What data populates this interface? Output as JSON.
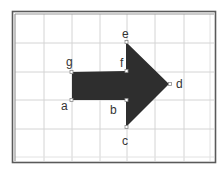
{
  "diagram": {
    "type": "arrow-on-grid",
    "colors": {
      "background": "#ffffff",
      "frame": "#5a5a5a",
      "frame_inner": "#9a9a9a",
      "grid": "#d4d4d4",
      "arrow_fill": "#2e2e2e",
      "point": "#8a8a8a",
      "label": "#333333"
    },
    "points": [
      {
        "name": "a",
        "label": "a"
      },
      {
        "name": "b",
        "label": "b"
      },
      {
        "name": "c",
        "label": "c"
      },
      {
        "name": "d",
        "label": "d"
      },
      {
        "name": "e",
        "label": "e"
      },
      {
        "name": "f",
        "label": "f"
      },
      {
        "name": "g",
        "label": "g"
      }
    ]
  }
}
